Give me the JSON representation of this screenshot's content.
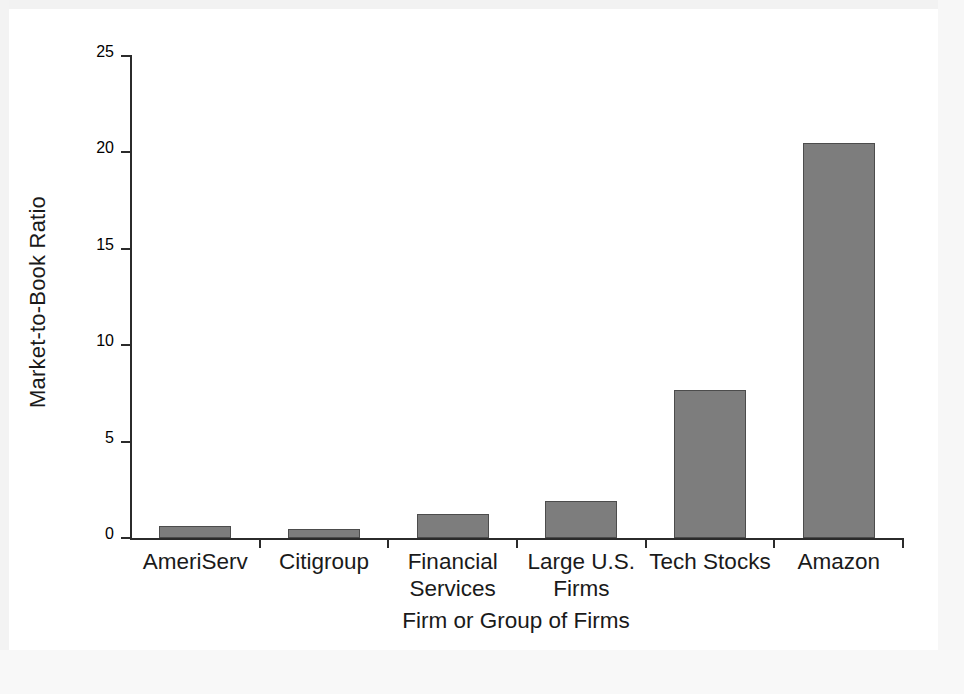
{
  "chart_data": {
    "type": "bar",
    "title": "",
    "xlabel": "Firm or Group of Firms",
    "ylabel": "Market-to-Book Ratio",
    "categories": [
      "AmeriServ",
      "Citigroup",
      "Financial\nServices",
      "Large U.S.\nFirms",
      "Tech Stocks",
      "Amazon"
    ],
    "values": [
      0.6,
      0.45,
      1.25,
      1.9,
      7.7,
      20.5
    ],
    "ylim": [
      0,
      25
    ],
    "yticks": [
      0,
      5,
      10,
      15,
      20,
      25
    ],
    "ytick_labels": [
      "0",
      "5",
      "10",
      "15",
      "20",
      "25"
    ],
    "grid": false,
    "legend": false,
    "legend_position": "none",
    "bar_color": "#7d7d7d",
    "bar_edge_color": "#4c4c4c",
    "axis_color": "#2b2b2b",
    "background": "#ffffff"
  }
}
